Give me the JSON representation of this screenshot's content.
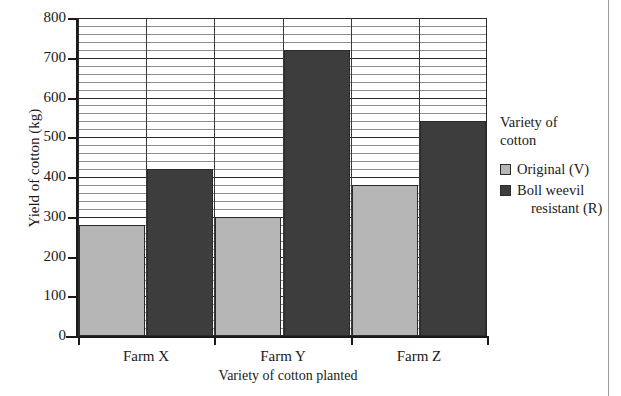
{
  "chart_data": {
    "type": "bar",
    "title": "",
    "xlabel": "Variety of cotton planted",
    "ylabel": "Yield of cotton (kg)",
    "categories": [
      "Farm X",
      "Farm Y",
      "Farm Z"
    ],
    "series": [
      {
        "name": "Original (V)",
        "color": "#b6b6b6",
        "values": [
          280,
          300,
          380
        ]
      },
      {
        "name": "Boll weevil resistant (R)",
        "color": "#3d3d3d",
        "values": [
          420,
          720,
          540
        ]
      }
    ],
    "ylim": [
      0,
      800
    ],
    "y_major_step": 100,
    "y_minor_step": 20,
    "y_tick_labels": [
      "0",
      "100",
      "200",
      "300",
      "400",
      "500",
      "600",
      "700",
      "800"
    ],
    "grid": "horizontal-major-and-minor plus vertical column separators",
    "legend_position": "right"
  },
  "legend": {
    "title_line1": "Variety of",
    "title_line2": "cotton",
    "entries": [
      {
        "label": "Original (V)",
        "label_cont": "",
        "swatch": "light"
      },
      {
        "label": "Boll weevil",
        "label_cont": "resistant (R)",
        "swatch": "dark"
      }
    ]
  }
}
